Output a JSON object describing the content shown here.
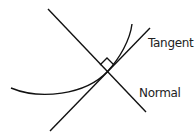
{
  "diagram": {
    "labels": {
      "tangent": "Tangent",
      "normal": "Normal"
    },
    "stroke_color": "#111111"
  }
}
